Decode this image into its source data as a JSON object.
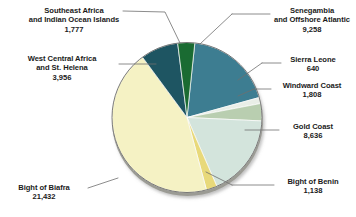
{
  "chart_data": {
    "type": "pie",
    "title": "",
    "subtitle": "",
    "xlabel": "",
    "ylabel": "",
    "legend_position": "none",
    "grid": false,
    "total": 48645,
    "categories": [
      "Senegambia and Offshore Atlantic",
      "Sierra Leone",
      "Windward Coast",
      "Gold Coast",
      "Bight of Benin",
      "Bight of Biafra",
      "West Central Africa and St. Helena",
      "Southeast Africa and Indian Ocean Islands"
    ],
    "values": [
      9258,
      640,
      1808,
      8636,
      1138,
      21432,
      3956,
      1777
    ],
    "colors": [
      "#3d7d91",
      "#e9eee7",
      "#b9ceb0",
      "#d3e4dc",
      "#e8d97a",
      "#f5f2c4",
      "#1e5562",
      "#1a6b32"
    ],
    "slices": [
      {
        "label_line1": "Senegambia",
        "label_line2": "and Offshore Atlantic",
        "value_text": "9,258",
        "value": 9258,
        "color": "#3d7d91"
      },
      {
        "label_line1": "Sierra Leone",
        "label_line2": "",
        "value_text": "640",
        "value": 640,
        "color": "#e9eee7"
      },
      {
        "label_line1": "Windward Coast",
        "label_line2": "",
        "value_text": "1,808",
        "value": 1808,
        "color": "#b9ceb0"
      },
      {
        "label_line1": "Gold Coast",
        "label_line2": "",
        "value_text": "8,636",
        "value": 8636,
        "color": "#d3e4dc"
      },
      {
        "label_line1": "Bight of Benin",
        "label_line2": "",
        "value_text": "1,138",
        "value": 1138,
        "color": "#e8d97a"
      },
      {
        "label_line1": "Bight of Biafra",
        "label_line2": "",
        "value_text": "21,432",
        "value": 21432,
        "color": "#f5f2c4"
      },
      {
        "label_line1": "West Central Africa",
        "label_line2": "and St. Helena",
        "value_text": "3,956",
        "value": 3956,
        "color": "#1e5562"
      },
      {
        "label_line1": "Southeast Africa",
        "label_line2": "and Indian Ocean Islands",
        "value_text": "1,777",
        "value": 1777,
        "color": "#1a6b32"
      }
    ]
  },
  "labels": {
    "southeast_africa": {
      "l1": "Southeast Africa",
      "l2": "and Indian Ocean Islands",
      "v": "1,777"
    },
    "west_central": {
      "l1": "West Central Africa",
      "l2": "and St. Helena",
      "v": "3,956"
    },
    "bight_biafra": {
      "l1": "Bight of Biafra",
      "l2": "",
      "v": "21,432"
    },
    "senegambia": {
      "l1": "Senegambia",
      "l2": "and Offshore Atlantic",
      "v": "9,258"
    },
    "sierra_leone": {
      "l1": "Sierra Leone",
      "l2": "",
      "v": "640"
    },
    "windward_coast": {
      "l1": "Windward Coast",
      "l2": "",
      "v": "1,808"
    },
    "gold_coast": {
      "l1": "Gold Coast",
      "l2": "",
      "v": "8,636"
    },
    "bight_benin": {
      "l1": "Bight of Benin",
      "l2": "",
      "v": "1,138"
    }
  },
  "style": {
    "background": "#ffffff",
    "text_color": "#1b1b1b",
    "leader_color": "#6e6e6e",
    "pie_outline": "#6b6b6b"
  }
}
